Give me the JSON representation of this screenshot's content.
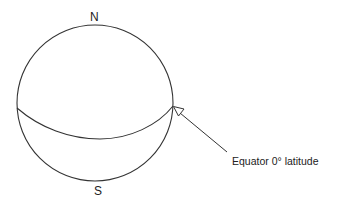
{
  "diagram": {
    "labels": {
      "north": "N",
      "south": "S",
      "equator": "Equator 0° latitude"
    },
    "colors": {
      "stroke": "#333333",
      "text": "#222222",
      "background": "#ffffff"
    },
    "elements": {
      "globe": {
        "shape": "circle",
        "cx": 95,
        "cy": 103,
        "r": 78
      },
      "equator_line": {
        "shape": "curve",
        "from": [
          17,
          108
        ],
        "to": [
          173,
          106
        ],
        "lowest_y": 138
      },
      "pointer_arrow": {
        "tip": [
          173,
          106
        ],
        "tail": [
          227,
          152
        ],
        "head": "open-triangle"
      }
    }
  }
}
